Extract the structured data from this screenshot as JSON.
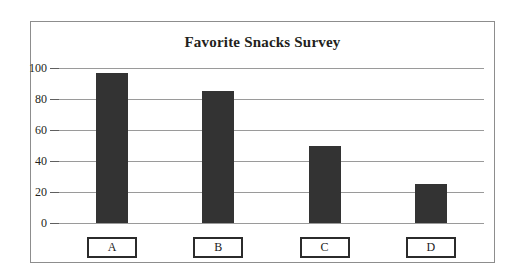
{
  "chart_data": {
    "type": "bar",
    "title": "Favorite Snacks Survey",
    "xlabel": "",
    "ylabel": "",
    "categories": [
      "A",
      "B",
      "C",
      "D"
    ],
    "values": [
      97,
      85,
      50,
      25
    ],
    "ylim": [
      0,
      100
    ],
    "yticks": [
      0,
      20,
      40,
      60,
      80,
      100
    ],
    "ytick_labels": [
      "0",
      "20",
      "40",
      "60",
      "80",
      "100"
    ],
    "grid": true,
    "legend": null,
    "bar_color": "#333333",
    "gridline_color": "#9a9a9a",
    "frame_color": "#8d8d8d",
    "background_color": "#ffffff",
    "title_color": "#231f20"
  }
}
